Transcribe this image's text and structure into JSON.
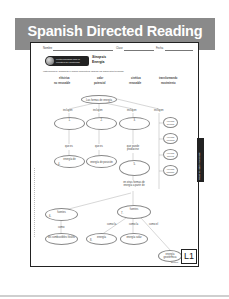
{
  "banner": {
    "title": "Spanish Directed Reading"
  },
  "worksheet": {
    "header_fields": {
      "name": "Nombre",
      "class": "Clase",
      "date": "Fecha"
    },
    "logo_text": [
      "Lectura Dirigida para la",
      "Maestría del Contenido"
    ],
    "section": {
      "label": "Sinopsis",
      "title": "Energía"
    },
    "instructions": "Instrucciones: Completa el mapa conceptual usando los siguientes términos.",
    "terms": [
      [
        "eléctrica",
        "no renovable"
      ],
      [
        "calor",
        "potencial"
      ],
      [
        "cinética",
        "renovable"
      ],
      [
        "transformando",
        "movimiento"
      ]
    ],
    "concept_map": {
      "root": "Las formas de energía",
      "incluyen_labels": [
        "incluyen",
        "incluyen",
        "incluyen",
        "incluyen"
      ],
      "branches": [
        {
          "number": "1.",
          "link": "que es",
          "child": "energía de",
          "child_number": "4."
        },
        {
          "number": "2.",
          "link": "que es",
          "child": "energía de posición"
        },
        {
          "number": "3.",
          "link": "que puede producirse",
          "child_number": "5."
        }
      ],
      "side_list": [
        "energía química",
        "energía eléctrica",
        "energía nuclear",
        "energía radiante"
      ],
      "transform_text": "en otras formas de energía a partir de",
      "sources": [
        {
          "label": "fuentes",
          "number": "6.",
          "link": "como",
          "child": "los combustibles fósiles"
        },
        {
          "label": "fuentes",
          "number": "7.",
          "links": [
            "como la",
            "como la",
            "como el"
          ],
          "children": [
            {
              "label": "energía",
              "number": "8."
            },
            {
              "label": "energía solar"
            },
            {
              "label": "energía geotérmica"
            }
          ]
        }
      ]
    },
    "side_tab": "Reading Additional Needs",
    "level_badge": "L1",
    "footer_note": "Energía"
  }
}
